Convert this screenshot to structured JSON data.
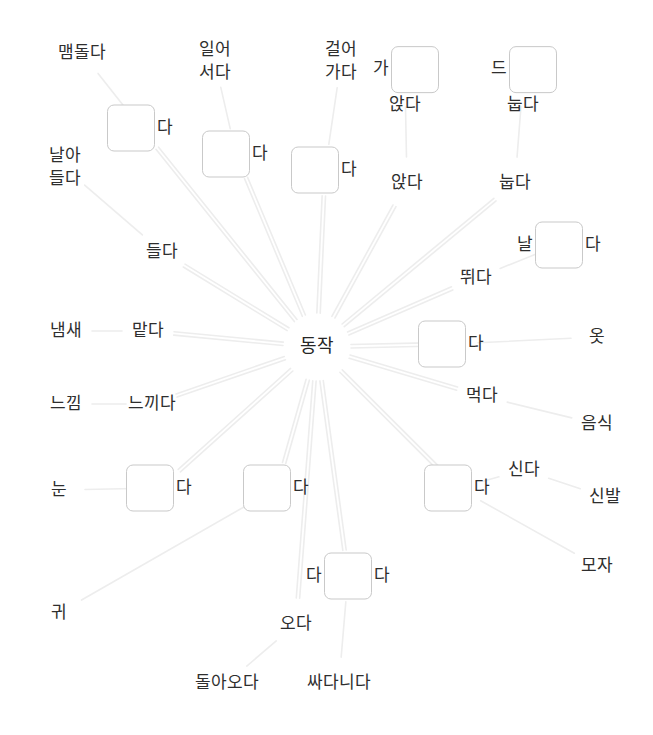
{
  "canvas": {
    "width": 653,
    "height": 735,
    "background": "#ffffff"
  },
  "style": {
    "edge_color": "#ededed",
    "box_border_color": "#c9c9c9",
    "text_color": "#2e2e2e"
  },
  "hub": {
    "label": "동작",
    "x": 317,
    "y": 347
  },
  "nodes": [
    {
      "id": "maemdolda",
      "type": "label",
      "text": "맴돌다",
      "x": 82,
      "y": 53
    },
    {
      "id": "box-maemdol",
      "type": "box",
      "pre": "",
      "post": "다",
      "x": 141,
      "y": 128
    },
    {
      "id": "naradeulda",
      "type": "label",
      "lines": [
        "날아",
        "들다"
      ],
      "x": 65,
      "y": 168
    },
    {
      "id": "deulda",
      "type": "label",
      "text": "들다",
      "x": 162,
      "y": 252
    },
    {
      "id": "naemsae",
      "type": "label",
      "text": "냄새",
      "x": 66,
      "y": 331
    },
    {
      "id": "matda",
      "type": "label",
      "text": "맡다",
      "x": 148,
      "y": 331
    },
    {
      "id": "neukkim",
      "type": "label",
      "text": "느낌",
      "x": 66,
      "y": 404
    },
    {
      "id": "neukkida",
      "type": "label",
      "text": "느끼다",
      "x": 152,
      "y": 404
    },
    {
      "id": "nun",
      "type": "label",
      "text": "눈",
      "x": 59,
      "y": 490
    },
    {
      "id": "box-nun",
      "type": "box",
      "pre": "",
      "post": "다",
      "x": 160,
      "y": 488
    },
    {
      "id": "gwi",
      "type": "label",
      "text": "귀",
      "x": 59,
      "y": 613
    },
    {
      "id": "box-deut",
      "type": "box",
      "pre": "",
      "post": "다",
      "x": 277,
      "y": 488
    },
    {
      "id": "box-danida",
      "type": "box",
      "pre": "다",
      "post": "다",
      "x": 348,
      "y": 576
    },
    {
      "id": "oda",
      "type": "label",
      "text": "오다",
      "x": 296,
      "y": 624
    },
    {
      "id": "doraoda",
      "type": "label",
      "text": "돌아오다",
      "x": 227,
      "y": 683
    },
    {
      "id": "ssadanida",
      "type": "label",
      "text": "싸다니다",
      "x": 339,
      "y": 683
    },
    {
      "id": "ireoseoda",
      "type": "label",
      "lines": [
        "일어",
        "서다"
      ],
      "x": 215,
      "y": 62
    },
    {
      "id": "box-seoda",
      "type": "box",
      "pre": "",
      "post": "다",
      "x": 236,
      "y": 154
    },
    {
      "id": "georeogada",
      "type": "label",
      "lines": [
        "걸어",
        "가다"
      ],
      "x": 341,
      "y": 62
    },
    {
      "id": "box-gada",
      "type": "box",
      "pre": "",
      "post": "다",
      "x": 325,
      "y": 170
    },
    {
      "id": "box-anjda",
      "type": "boxv",
      "pre": "가",
      "post": "앉다",
      "x": 405,
      "y": 81
    },
    {
      "id": "anjda",
      "type": "label",
      "text": "앉다",
      "x": 407,
      "y": 183
    },
    {
      "id": "box-nupda",
      "type": "boxv",
      "pre": "드",
      "post": "눕다",
      "x": 523,
      "y": 81
    },
    {
      "id": "nupda",
      "type": "label",
      "text": "눕다",
      "x": 515,
      "y": 183
    },
    {
      "id": "box-nalda",
      "type": "box",
      "pre": "날",
      "post": "다",
      "x": 559,
      "y": 245
    },
    {
      "id": "ttwida",
      "type": "label",
      "text": "뛰다",
      "x": 476,
      "y": 278
    },
    {
      "id": "box-ipda",
      "type": "box",
      "pre": "",
      "post": "다",
      "x": 452,
      "y": 344
    },
    {
      "id": "ot",
      "type": "label",
      "text": "옷",
      "x": 597,
      "y": 337
    },
    {
      "id": "meokda",
      "type": "label",
      "text": "먹다",
      "x": 482,
      "y": 396
    },
    {
      "id": "eumsik",
      "type": "label",
      "text": "음식",
      "x": 597,
      "y": 424
    },
    {
      "id": "box-sinda",
      "type": "box",
      "pre": "",
      "post": "다",
      "x": 458,
      "y": 488
    },
    {
      "id": "sinda",
      "type": "label",
      "text": "신다",
      "x": 524,
      "y": 470
    },
    {
      "id": "sinbal",
      "type": "label",
      "text": "신발",
      "x": 605,
      "y": 497
    },
    {
      "id": "moja",
      "type": "label",
      "text": "모자",
      "x": 597,
      "y": 566
    }
  ],
  "edges": [
    {
      "from": "maemdolda",
      "to": "box-maemdol"
    },
    {
      "from": "box-maemdol",
      "to": "hub"
    },
    {
      "from": "naradeulda",
      "to": "deulda"
    },
    {
      "from": "deulda",
      "to": "hub"
    },
    {
      "from": "naemsae",
      "to": "matda"
    },
    {
      "from": "matda",
      "to": "hub"
    },
    {
      "from": "neukkim",
      "to": "neukkida"
    },
    {
      "from": "neukkida",
      "to": "hub"
    },
    {
      "from": "nun",
      "to": "box-nun"
    },
    {
      "from": "box-nun",
      "to": "hub"
    },
    {
      "from": "gwi",
      "to": "box-deut"
    },
    {
      "from": "box-deut",
      "to": "hub"
    },
    {
      "from": "doraoda",
      "to": "oda"
    },
    {
      "from": "oda",
      "to": "hub"
    },
    {
      "from": "ssadanida",
      "to": "box-danida"
    },
    {
      "from": "box-danida",
      "to": "hub"
    },
    {
      "from": "ireoseoda",
      "to": "box-seoda"
    },
    {
      "from": "box-seoda",
      "to": "hub"
    },
    {
      "from": "georeogada",
      "to": "box-gada"
    },
    {
      "from": "box-gada",
      "to": "hub"
    },
    {
      "from": "box-anjda",
      "to": "anjda"
    },
    {
      "from": "anjda",
      "to": "hub"
    },
    {
      "from": "box-nupda",
      "to": "nupda"
    },
    {
      "from": "nupda",
      "to": "hub"
    },
    {
      "from": "box-nalda",
      "to": "ttwida"
    },
    {
      "from": "ttwida",
      "to": "hub"
    },
    {
      "from": "ot",
      "to": "box-ipda"
    },
    {
      "from": "box-ipda",
      "to": "hub"
    },
    {
      "from": "eumsik",
      "to": "meokda"
    },
    {
      "from": "meokda",
      "to": "hub"
    },
    {
      "from": "sinbal",
      "to": "sinda"
    },
    {
      "from": "sinda",
      "to": "box-sinda"
    },
    {
      "from": "box-sinda",
      "to": "hub"
    },
    {
      "from": "moja",
      "to": "box-sinda"
    }
  ]
}
